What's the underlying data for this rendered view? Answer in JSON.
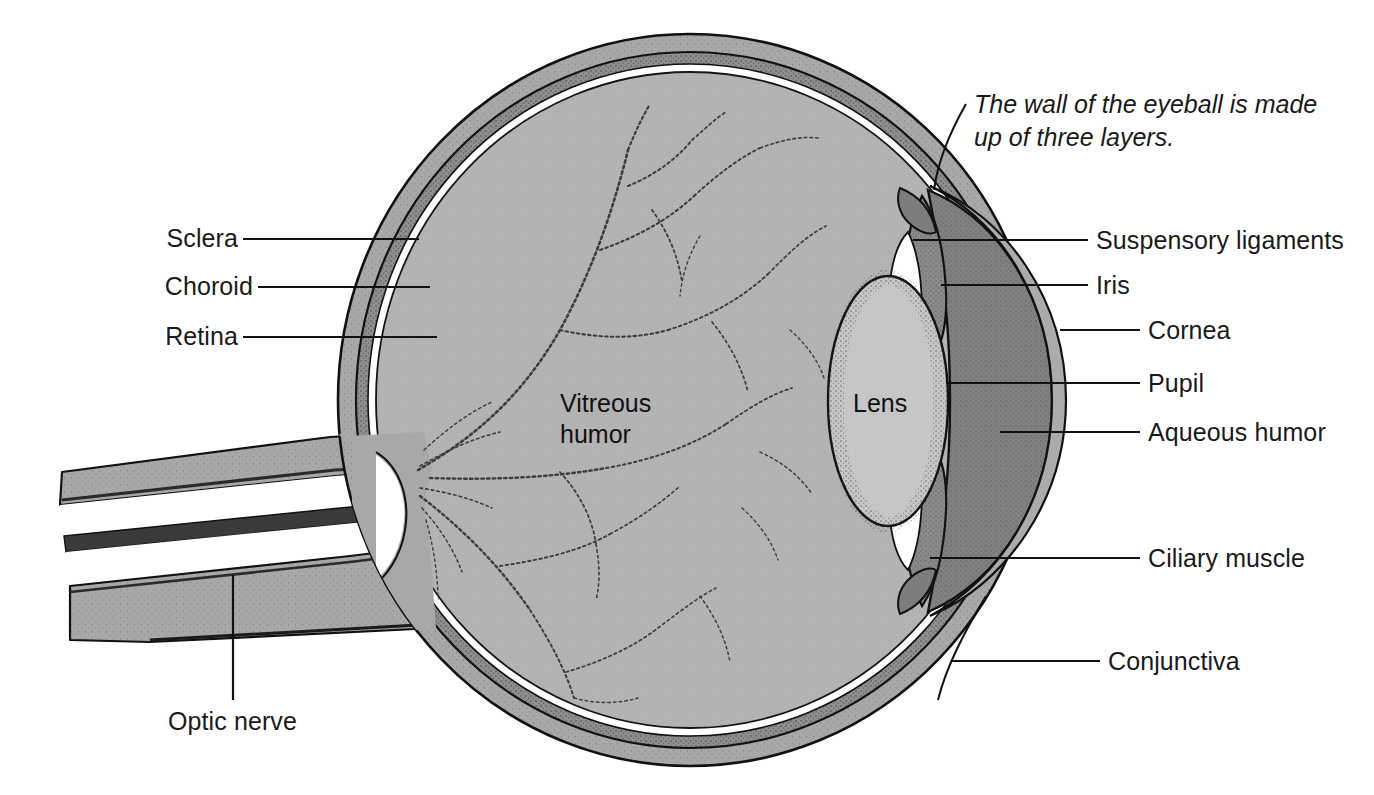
{
  "figure": {
    "caption": "The wall of the eyeball is made\nup of three layers."
  },
  "labels_left": [
    {
      "id": "sclera",
      "text": "Sclera"
    },
    {
      "id": "choroid",
      "text": "Choroid"
    },
    {
      "id": "retina",
      "text": "Retina"
    },
    {
      "id": "optic-nerve",
      "text": "Optic nerve"
    }
  ],
  "labels_right": [
    {
      "id": "suspensory-ligaments",
      "text": "Suspensory ligaments"
    },
    {
      "id": "iris",
      "text": "Iris"
    },
    {
      "id": "cornea",
      "text": "Cornea"
    },
    {
      "id": "pupil",
      "text": "Pupil"
    },
    {
      "id": "aqueous-humor",
      "text": "Aqueous humor"
    },
    {
      "id": "ciliary-muscle",
      "text": "Ciliary muscle"
    },
    {
      "id": "conjunctiva",
      "text": "Conjunctiva"
    }
  ],
  "labels_inner": [
    {
      "id": "vitreous-humor",
      "text": "Vitreous\nhumor"
    },
    {
      "id": "lens",
      "text": "Lens"
    }
  ],
  "colors": {
    "background": "#ffffff",
    "ink": "#1a1a1a",
    "sclera": "#a8a8a8",
    "choroid": "#8f8f8f",
    "retina_gap": "#ffffff",
    "vitreous": "#b5b5b5",
    "lens": "#c9c9c9",
    "aqueous": "#818181",
    "cornea": "#a5a5a5",
    "iris": "#8a8a8a",
    "nerve": "#a8a8a8",
    "vessel": "#3a3a3a",
    "leader": "#111111"
  }
}
